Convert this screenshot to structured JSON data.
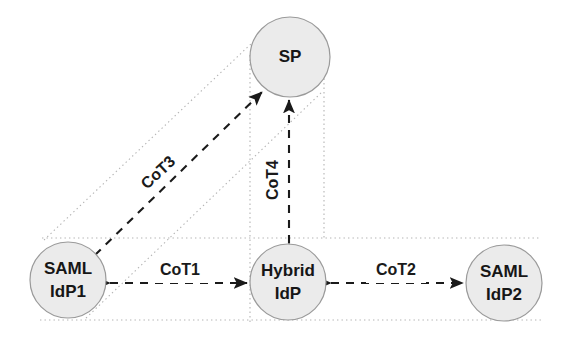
{
  "diagram": {
    "background_color": "#ffffff",
    "node_fill_color": "#ebebeb",
    "node_stroke_color": "#9a9a9a",
    "edge_color": "#1a1a1a",
    "boundary_color": "#b4b4b4",
    "nodes": [
      {
        "id": "sp",
        "label_line1": "SP",
        "label_line2": "",
        "cx": 290,
        "cy": 57,
        "r": 40
      },
      {
        "id": "saml-idp1",
        "label_line1": "SAML",
        "label_line2": "IdP1",
        "cx": 68,
        "cy": 280,
        "r": 38
      },
      {
        "id": "hybrid-idp",
        "label_line1": "Hybrid",
        "label_line2": "IdP",
        "cx": 288,
        "cy": 282,
        "r": 38
      },
      {
        "id": "saml-idp2",
        "label_line1": "SAML",
        "label_line2": "IdP2",
        "cx": 504,
        "cy": 283,
        "r": 38
      }
    ],
    "edges": [
      {
        "id": "cot1",
        "label": "CoT1",
        "from": "saml-idp1",
        "to": "hybrid-idp",
        "label_x": 180,
        "label_y": 271,
        "label_rotation": 0
      },
      {
        "id": "cot2",
        "label": "CoT2",
        "from": "hybrid-idp",
        "to": "saml-idp2",
        "label_x": 396,
        "label_y": 271,
        "label_rotation": 0
      },
      {
        "id": "cot3",
        "label": "CoT3",
        "from": "saml-idp1",
        "to": "sp",
        "label_x": 167,
        "label_y": 182,
        "label_rotation": -43
      },
      {
        "id": "cot4",
        "label": "CoT4",
        "from": "hybrid-idp",
        "to": "sp",
        "label_x": 274,
        "label_y": 180,
        "label_rotation": -90
      }
    ]
  }
}
